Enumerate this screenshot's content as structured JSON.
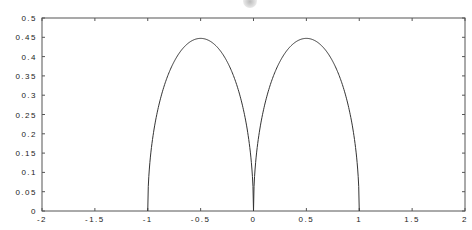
{
  "chart_data": {
    "type": "line",
    "title": "",
    "xlabel": "",
    "ylabel": "",
    "xlim": [
      -2,
      2
    ],
    "ylim": [
      0,
      0.5
    ],
    "grid": false,
    "legend": null,
    "x_ticks": [
      "-2",
      "-1.5",
      "-1",
      "-0.5",
      "0",
      "0.5",
      "1",
      "1.5",
      "2"
    ],
    "x_tick_values": [
      -2,
      -1.5,
      -1,
      -0.5,
      0,
      0.5,
      1,
      1.5,
      2
    ],
    "y_ticks": [
      "0",
      "0.05",
      "0.1",
      "0.15",
      "0.2",
      "0.25",
      "0.3",
      "0.35",
      "0.4",
      "0.45",
      "0.5"
    ],
    "y_tick_values": [
      0,
      0.05,
      0.1,
      0.15,
      0.2,
      0.25,
      0.3,
      0.35,
      0.4,
      0.45,
      0.5
    ],
    "series": [
      {
        "name": "curve",
        "color": "#333333",
        "description": "Two symmetric arches on [-1,0] and [0,1], zero at x=-1,0,1, peak ~0.447 at x=±0.5",
        "x": [
          -1,
          -0.99,
          -0.95,
          -0.9,
          -0.8,
          -0.7,
          -0.6,
          -0.5,
          -0.4,
          -0.3,
          -0.2,
          -0.1,
          -0.05,
          -0.01,
          0,
          0.01,
          0.05,
          0.1,
          0.2,
          0.3,
          0.4,
          0.5,
          0.6,
          0.7,
          0.8,
          0.9,
          0.95,
          0.99,
          1
        ],
        "y": [
          0,
          0.089,
          0.195,
          0.268,
          0.358,
          0.41,
          0.438,
          0.447,
          0.438,
          0.41,
          0.358,
          0.268,
          0.195,
          0.089,
          0,
          0.089,
          0.195,
          0.268,
          0.358,
          0.41,
          0.438,
          0.447,
          0.438,
          0.41,
          0.358,
          0.268,
          0.195,
          0.089,
          0
        ]
      }
    ]
  },
  "plot_area": {
    "left": 42,
    "right": 465,
    "top": 18,
    "bottom": 211
  }
}
